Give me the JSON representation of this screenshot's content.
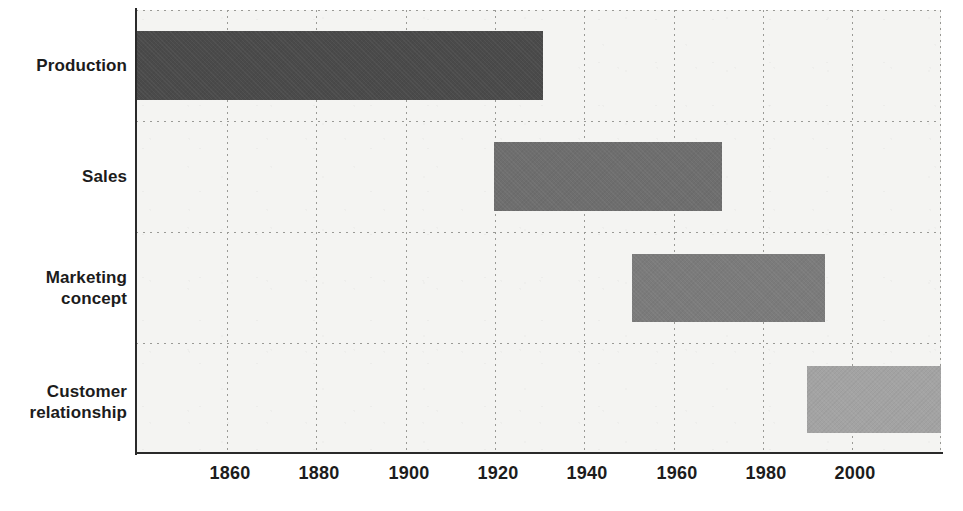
{
  "chart_data": {
    "type": "bar",
    "orientation": "horizontal",
    "title": "",
    "subtitle": "",
    "xlabel": "",
    "ylabel": "",
    "xlim": [
      1840,
      2020
    ],
    "grid": true,
    "legend": null,
    "categories": [
      "Production",
      "Sales",
      "Marketing\nconcept",
      "Customer\nrelationship"
    ],
    "xtick_labels": [
      "1860",
      "1880",
      "1900",
      "1920",
      "1940",
      "1960",
      "1980",
      "2000"
    ],
    "xtick_values": [
      1860,
      1880,
      1900,
      1920,
      1940,
      1960,
      1980,
      2000
    ],
    "bars": [
      {
        "label": "Production",
        "start": 1840,
        "end": 1931,
        "color": "#4a4a4a"
      },
      {
        "label": "Sales",
        "start": 1920,
        "end": 1971,
        "color": "#6e6e6e"
      },
      {
        "label": "Marketing concept",
        "start": 1951,
        "end": 1994,
        "color": "#7b7b7b"
      },
      {
        "label": "Customer relationship",
        "start": 1990,
        "end": 2020,
        "color": "#a3a3a3"
      }
    ],
    "colors": {
      "plot_background": "#f4f4f2",
      "page_background": "#ffffff",
      "axis": "#2a2a2a",
      "gridline": "#9a9a96",
      "text": "#1c1c1c"
    }
  }
}
